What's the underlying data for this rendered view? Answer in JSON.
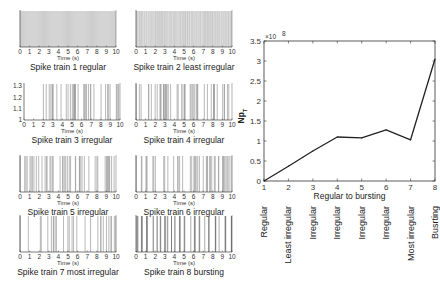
{
  "chart_data": [
    {
      "type": "raster",
      "title": "Spike train 1 regular",
      "xlabel": "Time (s)",
      "xlim": [
        0,
        10
      ],
      "xticks": [
        "0",
        "1",
        "2",
        "3",
        "4",
        "5",
        "6",
        "7",
        "8",
        "9",
        "10"
      ],
      "yticks": [],
      "pattern": "regular",
      "spike_rate_hz": 10
    },
    {
      "type": "raster",
      "title": "Spike train 2 least irregular",
      "xlabel": "Time (s)",
      "xlim": [
        0,
        10
      ],
      "xticks": [
        "0",
        "1",
        "2",
        "3",
        "4",
        "5",
        "6",
        "7",
        "8",
        "9",
        "10"
      ],
      "yticks": [],
      "pattern": "least irregular",
      "spike_rate_hz": 10
    },
    {
      "type": "raster",
      "title": "Spike train 3 irregular",
      "xlabel": "Time (s)",
      "xlim": [
        0,
        10
      ],
      "xticks": [
        "0",
        "1",
        "2",
        "3",
        "4",
        "5",
        "6",
        "7",
        "8",
        "9",
        "10"
      ],
      "yticks": [
        "1",
        "1.1",
        "1.2",
        "1.3"
      ],
      "pattern": "irregular",
      "spike_rate_hz": 5,
      "silent_until_s": 2
    },
    {
      "type": "raster",
      "title": "Spike train 4 irregular",
      "xlabel": "Time (s)",
      "xlim": [
        0,
        10
      ],
      "xticks": [
        "0",
        "1",
        "2",
        "3",
        "4",
        "5",
        "6",
        "7",
        "8",
        "9",
        "10"
      ],
      "yticks": [],
      "pattern": "irregular",
      "spike_rate_hz": 5
    },
    {
      "type": "raster",
      "title": "Spike train 5 irregular",
      "xlabel": "Time (s)",
      "xlim": [
        0,
        10
      ],
      "xticks": [
        "0",
        "1",
        "2",
        "3",
        "4",
        "5",
        "6",
        "7",
        "8",
        "9",
        "10"
      ],
      "yticks": [],
      "pattern": "irregular",
      "spike_rate_hz": 4
    },
    {
      "type": "raster",
      "title": "Spike train 6 irregular",
      "xlabel": "Time (s)",
      "xlim": [
        0,
        10
      ],
      "xticks": [
        "0",
        "1",
        "2",
        "3",
        "4",
        "5",
        "6",
        "7",
        "8",
        "9",
        "10"
      ],
      "yticks": [],
      "pattern": "irregular",
      "spike_rate_hz": 4
    },
    {
      "type": "raster",
      "title": "Spike train 7 most irregular",
      "xlabel": "Time (s)",
      "xlim": [
        0,
        10
      ],
      "xticks": [
        "0",
        "1",
        "2",
        "3",
        "4",
        "5",
        "6",
        "7",
        "8",
        "9",
        "10"
      ],
      "yticks": [],
      "pattern": "most irregular",
      "spike_rate_hz": 3
    },
    {
      "type": "raster",
      "title": "Spike train 8 bursting",
      "xlabel": "Time (s)",
      "xlim": [
        0,
        10
      ],
      "xticks": [
        "0",
        "1",
        "2",
        "3",
        "4",
        "5",
        "6",
        "7",
        "8",
        "9",
        "10"
      ],
      "yticks": [],
      "pattern": "bursting",
      "spike_rate_hz": 5
    },
    {
      "type": "line",
      "title": "",
      "xlabel": "Regular to bursting",
      "ylabel": "Np_T",
      "y_multiplier": "×10^8",
      "x": [
        1,
        2,
        3,
        4,
        5,
        6,
        7,
        8
      ],
      "xlim": [
        1,
        8
      ],
      "ylim": [
        0,
        3.5
      ],
      "xticks": [
        "1",
        "2",
        "3",
        "4",
        "5",
        "6",
        "7",
        "8"
      ],
      "yticks": [
        "0",
        "0.5",
        "1",
        "1.5",
        "2",
        "2.5",
        "3",
        "3.5"
      ],
      "series": [
        {
          "name": "Np_T",
          "values": [
            0.0,
            0.37,
            0.75,
            1.1,
            1.08,
            1.28,
            1.03,
            3.05
          ]
        }
      ],
      "categories": [
        "Regular",
        "Least irregular",
        "Irregular",
        "Irregular",
        "Irregular",
        "Irregular",
        "Most irregular",
        "Busrting"
      ],
      "grid": false,
      "legend": "none"
    }
  ]
}
